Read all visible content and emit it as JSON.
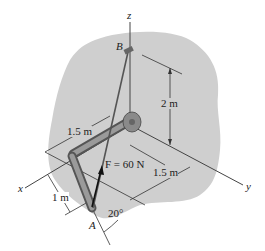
{
  "diagram": {
    "axes": {
      "x": "x",
      "y": "y",
      "z": "z"
    },
    "points": {
      "A": "A",
      "B": "B"
    },
    "force": {
      "label": "F = 60 N",
      "symbol": "F",
      "value": "60 N"
    },
    "dimensions": {
      "vertical": "2 m",
      "pipe_segment": "1.5 m",
      "y_offset": "1.5 m",
      "short_segment": "1 m"
    },
    "angle": "20°",
    "colors": {
      "wall": "#cfcfcf",
      "pipe": "#8a8a8a",
      "pipe_dark": "#555555",
      "ink": "#222222"
    }
  }
}
